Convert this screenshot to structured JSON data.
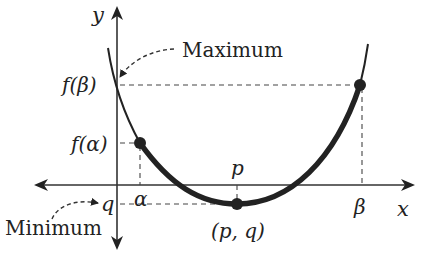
{
  "diagram": {
    "type": "parabola-max-min-on-interval",
    "axes": {
      "x_label": "x",
      "y_label": "y"
    },
    "labels": {
      "f_beta": "f(β)",
      "f_alpha": "f(α)",
      "q": "q",
      "alpha": "α",
      "p": "p",
      "beta": "β",
      "vertex": "(p, q)",
      "maximum": "Maximum",
      "minimum": "Minimum"
    },
    "points": [
      {
        "name": "alpha-point",
        "label": "(α, f(α))"
      },
      {
        "name": "vertex-point",
        "label": "(p, q)"
      },
      {
        "name": "beta-point",
        "label": "(β, f(β))"
      }
    ],
    "colors": {
      "stroke": "#222222",
      "background": "#ffffff"
    }
  }
}
